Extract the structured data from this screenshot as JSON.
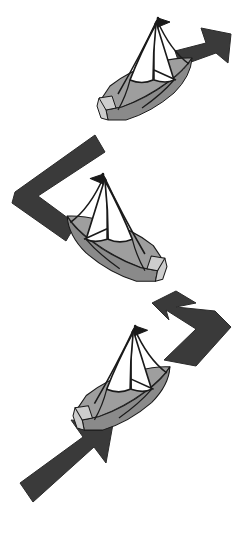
{
  "diagram": {
    "maneuver": "tacking upwind",
    "background_color": "#ffffff",
    "canvas": {
      "width": 249,
      "height": 536
    }
  },
  "palette": {
    "arrow_fill": "#3a3a3a",
    "arrow_stroke": "#2b2b2b",
    "hull_fill": "#9e9e9e",
    "hull_shadow_fill": "#8a8a8a",
    "hull_deck_fill": "#b5b5b5",
    "hull_transom_fill": "#cdcdcd",
    "sail_fill": "#ffffff",
    "sail_shade_fill": "#a8a8a8",
    "outline": "#1a1a1a",
    "background": "#ffffff"
  },
  "boats": [
    {
      "id": "boat-top",
      "label": "Sailboat on starboard tack (upper)",
      "heading": "up-right",
      "mirrored": false,
      "position": {
        "x": 96,
        "y": 14
      },
      "burgee_direction": "right"
    },
    {
      "id": "boat-middle",
      "label": "Sailboat on port tack (middle)",
      "heading": "down-right",
      "mirrored": true,
      "position": {
        "x": 62,
        "y": 170
      },
      "burgee_direction": "left"
    },
    {
      "id": "boat-bottom",
      "label": "Sailboat on starboard tack (lower)",
      "heading": "up-right",
      "mirrored": false,
      "position": {
        "x": 72,
        "y": 322
      },
      "burgee_direction": "right"
    }
  ],
  "arrows": [
    {
      "id": "arrow-top-right",
      "label": "Exit course arrow pointing up-right",
      "type": "straight",
      "direction": "up-right",
      "head_at": "top-right"
    },
    {
      "id": "arrow-upper-bend",
      "label": "Bent course arrow between upper and middle boat",
      "type": "bent-chevron-left",
      "direction": "left-then-down-right",
      "head_at": "none"
    },
    {
      "id": "arrow-lower-bend",
      "label": "Bent course arrow between middle and lower boat",
      "type": "bent-chevron-right",
      "direction": "right-then-up-left",
      "head_at": "top-left"
    },
    {
      "id": "arrow-bottom-left",
      "label": "Entry course arrow pointing up-right",
      "type": "straight",
      "direction": "up-right",
      "head_at": "top-right"
    }
  ]
}
